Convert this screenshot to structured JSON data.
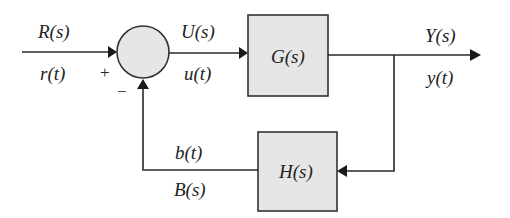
{
  "diagram": {
    "type": "feedback-control-block-diagram",
    "colors": {
      "block_fill": "#e6e6e6",
      "line": "#2a2a2a",
      "background": "#ffffff"
    },
    "signals": {
      "input_s": "R(s)",
      "input_t": "r(t)",
      "control_s": "U(s)",
      "control_t": "u(t)",
      "output_s": "Y(s)",
      "output_t": "y(t)",
      "feedback_t": "b(t)",
      "feedback_s": "B(s)"
    },
    "summing_junction": {
      "plus": "+",
      "minus": "−"
    },
    "blocks": {
      "forward": "G(s)",
      "feedback": "H(s)"
    }
  }
}
